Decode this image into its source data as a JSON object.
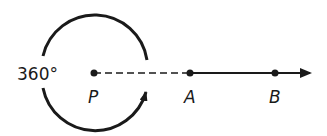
{
  "diagram": {
    "angle_label": "360°",
    "points": [
      {
        "name": "P",
        "x": 94,
        "y": 73
      },
      {
        "name": "A",
        "x": 190,
        "y": 73
      },
      {
        "name": "B",
        "x": 275,
        "y": 73
      }
    ],
    "colors": {
      "stroke": "#1a1a1a",
      "background": "#ffffff"
    }
  }
}
